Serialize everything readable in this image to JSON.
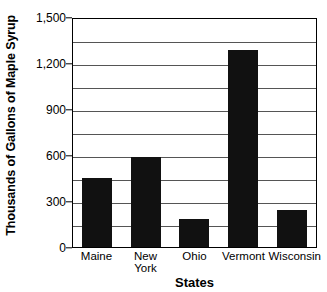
{
  "chart_data": {
    "type": "bar",
    "title": "",
    "xlabel": "States",
    "ylabel": "Thousands of Gallons of Maple Syrup",
    "categories": [
      "Maine",
      "New\nYork",
      "Ohio",
      "Vermont",
      "Wisconsin"
    ],
    "values": [
      450,
      590,
      185,
      1285,
      240
    ],
    "ylim": [
      0,
      1500
    ],
    "ytick_labels": [
      "1,500",
      "1,200",
      "900",
      "600",
      "300",
      "0"
    ],
    "ytick_values": [
      1500,
      1200,
      900,
      600,
      300,
      0
    ],
    "gridline_values": [
      1350,
      1200,
      1050,
      900,
      750,
      600,
      450,
      300,
      150
    ],
    "grid": true,
    "legend": "none",
    "bar_color": "#111111",
    "grid_color": "#555555",
    "axis_color": "#000000"
  },
  "labels": {
    "y_axis_title": "Thousands of Gallons of Maple Syrup",
    "x_axis_title": "States"
  }
}
